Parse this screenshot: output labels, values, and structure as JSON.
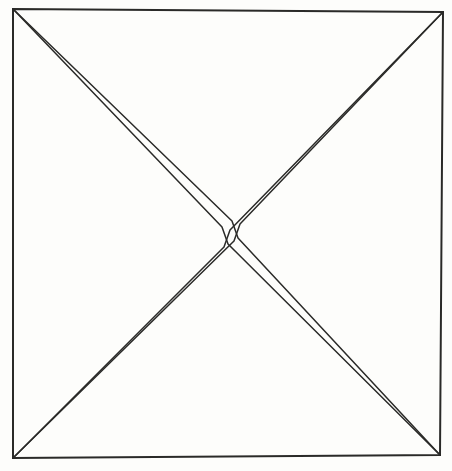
{
  "figure": {
    "canvas": {
      "width": 452,
      "height": 471
    },
    "colors": {
      "background": "#fdfdfb",
      "page": "#ffffff",
      "ink": "#2a2a28",
      "ink_light": "#50504c"
    },
    "stroke": {
      "frame_width": 2.0,
      "diagonal_width": 1.5
    },
    "frame": {
      "name": "outer-square",
      "corners": {
        "top_left": {
          "x": 13,
          "y": 9
        },
        "top_right": {
          "x": 443,
          "y": 12
        },
        "bottom_right": {
          "x": 440,
          "y": 455
        },
        "bottom_left": {
          "x": 13,
          "y": 458
        }
      },
      "points": "13,9 443,12 440,455 13,458"
    },
    "center": {
      "x": 230,
      "y": 233
    },
    "wedges": [
      {
        "name": "wedge-top-left-to-bottom-right",
        "from": {
          "x": 13,
          "y": 9
        },
        "to": {
          "x": 440,
          "y": 455
        },
        "outer_path": "M 13 9 L 222 227 L 228 244 L 440 455",
        "inner_path": "M 13 9 L 232 221 L 238 238 L 440 455",
        "max_gap_px": 5
      },
      {
        "name": "wedge-top-right-to-bottom-left",
        "from": {
          "x": 443,
          "y": 12
        },
        "to": {
          "x": 13,
          "y": 458
        },
        "outer_path": "M 443 12 L 240 224 L 234 241 L 13 458",
        "inner_path": "M 443 12 L 230 230 L 224 247 L 13 458",
        "max_gap_px": 5
      }
    ]
  }
}
